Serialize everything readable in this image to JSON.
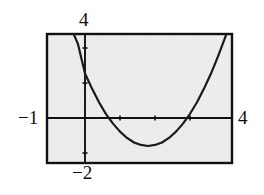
{
  "figure": {
    "kind": "cartesian-graph",
    "background_color": "#ffffff",
    "plot_fill_color": "#ececec",
    "stroke_color": "#111111"
  },
  "labels": {
    "top": "4",
    "left": "−1",
    "right": "4",
    "bottom": "−2"
  },
  "chart_data": {
    "type": "line",
    "title": "",
    "xlabel": "",
    "ylabel": "",
    "xlim": [
      -1,
      4
    ],
    "ylim": [
      -2,
      4
    ],
    "grid": false,
    "legend": null,
    "axis_labels_shown": {
      "x_min": "-1",
      "x_max": "4",
      "y_min": "-2",
      "y_max": "4"
    },
    "x_ticks": [
      1,
      2,
      3
    ],
    "y_ticks": [
      -1,
      1,
      2
    ],
    "curve": {
      "name": "parabola",
      "expression": "y = 0.64(x - 1.8)^2 - 0.8",
      "vertex": [
        1.8,
        -0.8
      ],
      "roots": [
        0.68,
        2.92
      ],
      "x": [
        -1.0,
        -0.8,
        -0.6,
        -0.4,
        -0.2,
        0.0,
        0.2,
        0.4,
        0.6,
        0.8,
        1.0,
        1.2,
        1.4,
        1.6,
        1.8,
        2.0,
        2.2,
        2.4,
        2.6,
        2.8,
        3.0,
        3.2,
        3.4,
        3.6,
        3.8,
        4.0,
        4.1
      ],
      "y": [
        4.24,
        3.64,
        3.09,
        2.58,
        2.11,
        1.27,
        0.84,
        0.45,
        0.11,
        -0.16,
        -0.39,
        -0.57,
        -0.7,
        -0.77,
        -0.8,
        -0.77,
        -0.7,
        -0.57,
        -0.39,
        -0.16,
        0.12,
        0.45,
        0.84,
        1.27,
        1.76,
        2.29,
        2.56
      ]
    }
  }
}
